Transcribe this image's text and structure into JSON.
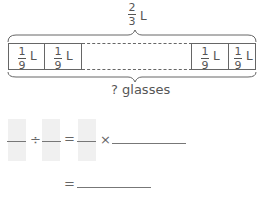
{
  "diagram": {
    "total": {
      "numerator": "2",
      "denominator": "3",
      "unit": "L"
    },
    "cells": [
      {
        "numerator": "1",
        "denominator": "9",
        "unit": "L"
      },
      {
        "numerator": "1",
        "denominator": "9",
        "unit": "L"
      },
      {
        "numerator": "1",
        "denominator": "9",
        "unit": "L"
      },
      {
        "numerator": "1",
        "denominator": "9",
        "unit": "L"
      }
    ],
    "bottom_label": "? glasses"
  },
  "equation": {
    "divide_symbol": "÷",
    "equals_symbol": "=",
    "times_symbol": "×"
  }
}
